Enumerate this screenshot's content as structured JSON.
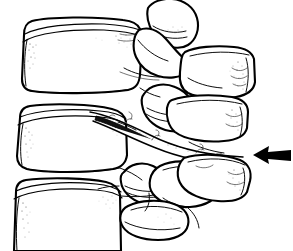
{
  "figure": {
    "view": "lateral (side) view",
    "style": "black-and-white medical line art with stipple shading",
    "background_color": "#ffffff",
    "line_color": "#000000",
    "width_px": 293,
    "height_px": 251,
    "visible_text": "",
    "labels": []
  },
  "annotation": {
    "arrow": {
      "name": "fracture-indicator-arrow",
      "direction": "left",
      "color": "#000000",
      "tip_x": 253,
      "tip_y": 155,
      "tail_x": 291,
      "tail_y": 155,
      "points_to": "posterior element fracture site"
    }
  },
  "structures": [
    {
      "id": "upper-vertebral-body",
      "label": "Upper vertebral body",
      "region": "anterior-superior",
      "bbox": [
        18,
        18,
        145,
        110
      ]
    },
    {
      "id": "upper-superior-articular-process",
      "label": "Upper superior articular process",
      "region": "posterior-superior",
      "bbox": [
        148,
        0,
        200,
        55
      ]
    },
    {
      "id": "upper-spinous-process",
      "label": "Upper spinous process",
      "region": "posterior-superior",
      "bbox": [
        185,
        45,
        256,
        100
      ]
    },
    {
      "id": "middle-vertebral-body",
      "label": "Middle vertebral body",
      "region": "anterior-middle",
      "bbox": [
        14,
        105,
        132,
        190
      ]
    },
    {
      "id": "middle-articular-process",
      "label": "Middle articular process",
      "region": "posterior-middle",
      "bbox": [
        138,
        82,
        190,
        135
      ]
    },
    {
      "id": "middle-spinous-process",
      "label": "Middle spinous process",
      "region": "posterior-middle",
      "bbox": [
        165,
        88,
        248,
        145
      ]
    },
    {
      "id": "fracture-cleft",
      "label": "Fracture cleft / distraction gap",
      "region": "posterior-middle",
      "bbox": [
        88,
        110,
        245,
        165
      ]
    },
    {
      "id": "lower-vertebral-body",
      "label": "Lower vertebral body",
      "region": "anterior-inferior",
      "bbox": [
        10,
        178,
        120,
        251
      ]
    },
    {
      "id": "lower-articular-processes",
      "label": "Lower articular processes",
      "region": "posterior-inferior",
      "bbox": [
        118,
        155,
        200,
        215
      ]
    },
    {
      "id": "lower-spinous-process",
      "label": "Lower spinous process",
      "region": "posterior-inferior",
      "bbox": [
        170,
        150,
        255,
        205
      ]
    },
    {
      "id": "inferior-spinous-tip",
      "label": "Inferior spinous process tip",
      "region": "posterior-inferior",
      "bbox": [
        118,
        200,
        190,
        240
      ]
    }
  ]
}
